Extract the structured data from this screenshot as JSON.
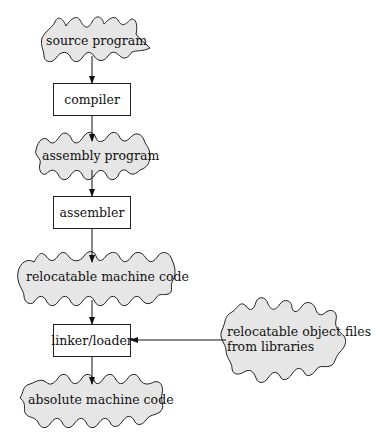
{
  "diagram": {
    "nodes": [
      {
        "id": "source",
        "shape": "cloud",
        "label": "source program"
      },
      {
        "id": "compiler",
        "shape": "box",
        "label": "compiler"
      },
      {
        "id": "assembly",
        "shape": "cloud",
        "label": "assembly program"
      },
      {
        "id": "assembler",
        "shape": "box",
        "label": "assembler"
      },
      {
        "id": "relocatable",
        "shape": "cloud",
        "label": "relocatable machine code"
      },
      {
        "id": "linker",
        "shape": "box",
        "label": "linker/loader"
      },
      {
        "id": "absolute",
        "shape": "cloud",
        "label": "absolute machine code"
      },
      {
        "id": "libraries",
        "shape": "cloud",
        "label_line1": "relocatable object files",
        "label_line2": "from libraries"
      }
    ],
    "edges": [
      [
        "source",
        "compiler"
      ],
      [
        "compiler",
        "assembly"
      ],
      [
        "assembly",
        "assembler"
      ],
      [
        "assembler",
        "relocatable"
      ],
      [
        "relocatable",
        "linker"
      ],
      [
        "libraries",
        "linker"
      ],
      [
        "linker",
        "absolute"
      ]
    ],
    "colors": {
      "cloud_fill": "#e6e6e6",
      "stroke": "#222222"
    }
  }
}
